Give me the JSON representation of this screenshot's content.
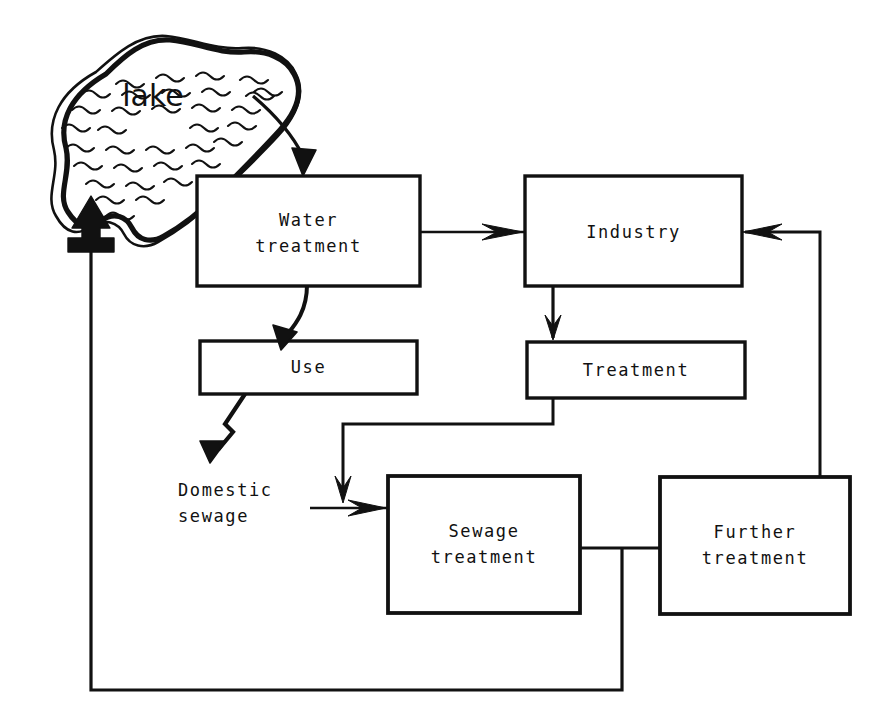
{
  "diagram": {
    "stroke_color": "#111111",
    "background_color": "#ffffff",
    "water_body": {
      "label": "lake",
      "shape": "hand-drawn blob with wavy water hatching"
    },
    "nodes": [
      {
        "id": "water_treatment",
        "label": "Water\ntreatment",
        "x": 197,
        "y": 176,
        "w": 223,
        "h": 110
      },
      {
        "id": "industry",
        "label": "Industry",
        "x": 525,
        "y": 176,
        "w": 217,
        "h": 110
      },
      {
        "id": "use",
        "label": "Use",
        "x": 200,
        "y": 341,
        "w": 217,
        "h": 53
      },
      {
        "id": "treatment",
        "label": "Treatment",
        "x": 527,
        "y": 342,
        "w": 218,
        "h": 56
      },
      {
        "id": "sewage_treatment",
        "label": "Sewage\ntreatment",
        "x": 388,
        "y": 476,
        "w": 192,
        "h": 137
      },
      {
        "id": "further_treatment",
        "label": "Further\ntreatment",
        "x": 660,
        "y": 477,
        "w": 190,
        "h": 137
      }
    ],
    "free_labels": [
      {
        "id": "domestic_sewage",
        "label": "Domestic\nsewage",
        "x": 178,
        "y": 477
      }
    ],
    "edges": [
      {
        "from": "lake",
        "to": "water_treatment",
        "style": "curved-arrow"
      },
      {
        "from": "water_treatment",
        "to": "industry",
        "style": "straight-arrow"
      },
      {
        "from": "water_treatment",
        "to": "use",
        "style": "curved-arrow"
      },
      {
        "from": "use",
        "to": "domestic_sewage",
        "style": "zigzag-arrow"
      },
      {
        "from": "industry",
        "to": "treatment",
        "style": "straight-arrow"
      },
      {
        "from": "treatment",
        "to": "sewage_treatment",
        "style": "orthogonal-arrow"
      },
      {
        "from": "domestic_sewage",
        "to": "sewage_treatment",
        "style": "straight-arrow"
      },
      {
        "from": "sewage_treatment",
        "to": "further_treatment",
        "style": "plain-line"
      },
      {
        "from": "further_treatment",
        "to": "industry",
        "style": "orthogonal-arrow"
      },
      {
        "from": "sewage_treatment",
        "to": "lake",
        "style": "orthogonal-arrow-return"
      }
    ]
  }
}
